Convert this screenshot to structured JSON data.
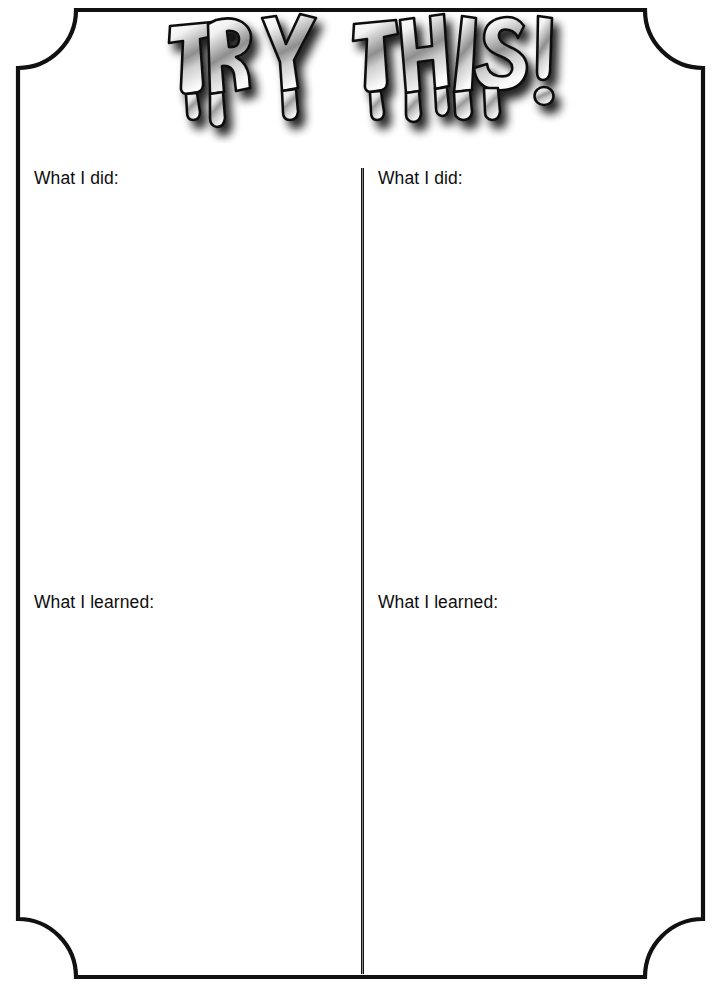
{
  "page": {
    "title_text": "TRY THIS!",
    "title_words": [
      "TRY",
      "THIS!"
    ],
    "background_color": "#ffffff",
    "ink_color": "#111111",
    "width": 721,
    "height": 987
  },
  "frame": {
    "style": "rectangle-with-concave-notched-corners",
    "border_color": "#111111",
    "border_thickness_px": 4,
    "corner_notch_radius_px": 58
  },
  "divider": {
    "orientation": "vertical",
    "color": "#111111"
  },
  "columns": [
    {
      "id": "left",
      "did_label": "What I did:",
      "did_value": "",
      "did_placeholder": "",
      "learned_label": "What I learned:",
      "learned_value": "",
      "learned_placeholder": ""
    },
    {
      "id": "right",
      "did_label": "What I did:",
      "did_value": "",
      "did_placeholder": "",
      "learned_label": "What I learned:",
      "learned_value": "",
      "learned_placeholder": ""
    }
  ]
}
